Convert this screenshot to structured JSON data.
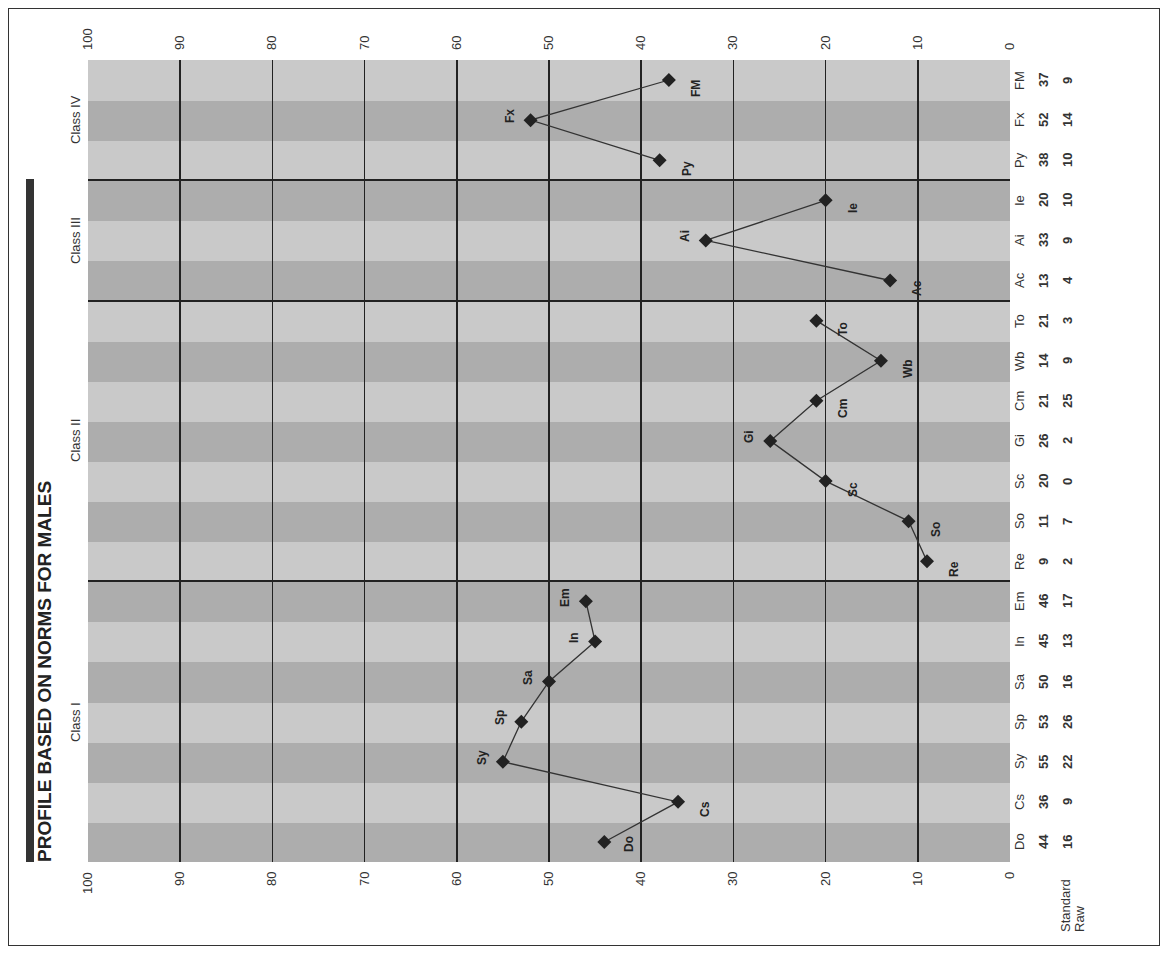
{
  "title": "PROFILE BASED ON NORMS FOR MALES",
  "colors": {
    "stripe_light": "#c9c9c9",
    "stripe_dark": "#adadad",
    "grid": "#222222",
    "marker": "#222222"
  },
  "row_headers": {
    "standard": "Standard",
    "raw": "Raw"
  },
  "classes": [
    {
      "label": "Class I",
      "scales": [
        "Do",
        "Cs",
        "Sy",
        "Sp",
        "Sa",
        "In",
        "Em"
      ]
    },
    {
      "label": "Class II",
      "scales": [
        "Re",
        "So",
        "Sc",
        "Gi",
        "Cm",
        "Wb",
        "To"
      ]
    },
    {
      "label": "Class III",
      "scales": [
        "Ac",
        "Ai",
        "Ie"
      ]
    },
    {
      "label": "Class IV",
      "scales": [
        "Py",
        "Fx",
        "FM"
      ]
    }
  ],
  "chart_data": {
    "type": "line",
    "title": "PROFILE BASED ON NORMS FOR MALES",
    "orientation": "rotated 90 degrees counter-clockwise (value axis horizontal, 100 at left, 0 at right)",
    "categories": [
      "Do",
      "Cs",
      "Sy",
      "Sp",
      "Sa",
      "In",
      "Em",
      "Re",
      "So",
      "Sc",
      "Gi",
      "Cm",
      "Wb",
      "To",
      "Ac",
      "Ai",
      "Ie",
      "Py",
      "Fx",
      "FM"
    ],
    "series": [
      {
        "name": "Standard",
        "values": [
          44,
          36,
          55,
          53,
          50,
          45,
          46,
          9,
          11,
          20,
          26,
          21,
          14,
          21,
          13,
          33,
          20,
          38,
          52,
          37
        ]
      },
      {
        "name": "Raw",
        "values": [
          16,
          9,
          22,
          26,
          16,
          13,
          17,
          2,
          7,
          0,
          2,
          25,
          9,
          3,
          4,
          9,
          10,
          10,
          14,
          9
        ]
      }
    ],
    "plotted_series": "Standard",
    "segments": [
      [
        0,
        6
      ],
      [
        7,
        13
      ],
      [
        14,
        16
      ],
      [
        17,
        19
      ]
    ],
    "groups": [
      {
        "label": "Class I",
        "from": "Do",
        "to": "Em"
      },
      {
        "label": "Class II",
        "from": "Re",
        "to": "To"
      },
      {
        "label": "Class III",
        "from": "Ac",
        "to": "Ie"
      },
      {
        "label": "Class IV",
        "from": "Py",
        "to": "FM"
      }
    ],
    "value_ticks": [
      100,
      90,
      80,
      70,
      60,
      50,
      40,
      30,
      20,
      10,
      0
    ],
    "ylim": [
      0,
      100
    ],
    "xlabel": "",
    "ylabel": "",
    "grid": true,
    "legend": "none"
  }
}
